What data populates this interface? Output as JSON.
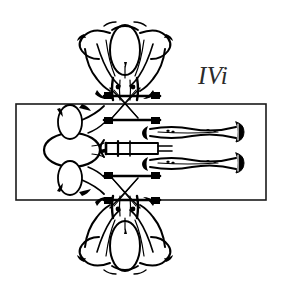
{
  "figure": {
    "title": "IVi",
    "domain": "line-diagram",
    "background_color": "#ffffff",
    "ink_color": "#000000",
    "label": {
      "text": "IVi",
      "style": "italic",
      "color": "#2b2b2b",
      "font_size_px": 25,
      "x": 198,
      "y": 84
    },
    "frame_rect": {
      "name": "outline-rectangle",
      "x": 16,
      "y": 104,
      "width": 250,
      "height": 96,
      "stroke_color": "#1a1a1a",
      "stroke_width": 1.6,
      "fill": "none"
    },
    "specimen": {
      "name": "bilateral-skeletal-specimen",
      "description": "Bilaterally symmetric black-and-white anatomical line drawing centred on the rectangle, with upper and lower lobed masses, a left-hand rounded head mass, two elongated tapering limbs extending to the right, a central horizontal rod and crossing band elements.",
      "center_x": 132,
      "center_y": 148,
      "extent_top_y": 20,
      "extent_bottom_y": 272,
      "extent_left_x": 40,
      "extent_right_x": 245
    },
    "parts": [
      {
        "name": "upper-lobe-cluster",
        "label": "upper lobed mass"
      },
      {
        "name": "lower-lobe-cluster",
        "label": "lower lobed mass"
      },
      {
        "name": "left-head-mass",
        "label": "left rounded head mass"
      },
      {
        "name": "right-limb-upper",
        "label": "upper right tapering limb"
      },
      {
        "name": "right-limb-lower",
        "label": "lower right tapering limb"
      },
      {
        "name": "central-rod",
        "label": "central horizontal rod"
      },
      {
        "name": "crossing-bands-upper",
        "label": "upper crossing bands"
      },
      {
        "name": "crossing-bands-lower",
        "label": "lower crossing bands"
      }
    ]
  }
}
